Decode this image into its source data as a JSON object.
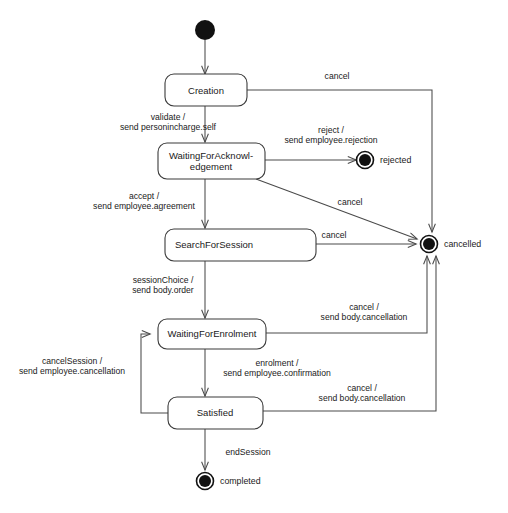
{
  "diagram": {
    "type": "uml-state-diagram",
    "colors": {
      "background": "#ffffff",
      "stroke": "#4a4a4a",
      "box_stroke": "#3b3b3b",
      "text": "#1a1a1a",
      "node_fill": "#111111"
    },
    "states": [
      {
        "id": "creation",
        "label": "Creation",
        "kind": "state"
      },
      {
        "id": "waiting_ack",
        "label_line1": "WaitingForAcknowl-",
        "label_line2": "edgement",
        "label": "WaitingForAcknowledgement",
        "kind": "state"
      },
      {
        "id": "search",
        "label": "SearchForSession",
        "kind": "state"
      },
      {
        "id": "waiting_enrolment",
        "label": "WaitingForEnrolment",
        "kind": "state"
      },
      {
        "id": "satisfied",
        "label": "Satisfied",
        "kind": "state"
      }
    ],
    "pseudostates": [
      {
        "id": "initial",
        "label": "",
        "kind": "initial"
      },
      {
        "id": "rejected",
        "label": "rejected",
        "kind": "final"
      },
      {
        "id": "cancelled",
        "label": "cancelled",
        "kind": "final"
      },
      {
        "id": "completed",
        "label": "completed",
        "kind": "final"
      }
    ],
    "transitions": [
      {
        "id": "t1",
        "from": "initial",
        "to": "creation",
        "label": ""
      },
      {
        "id": "t2",
        "from": "creation",
        "to": "waiting_ack",
        "line1": "validate /",
        "line2": "send personincharge.self"
      },
      {
        "id": "t3",
        "from": "creation",
        "to": "cancelled",
        "line1": "cancel",
        "line2": ""
      },
      {
        "id": "t4",
        "from": "waiting_ack",
        "to": "rejected",
        "line1": "reject /",
        "line2": "send employee.rejection"
      },
      {
        "id": "t5",
        "from": "waiting_ack",
        "to": "search",
        "line1": "accept /",
        "line2": "send employee.agreement"
      },
      {
        "id": "t6",
        "from": "waiting_ack",
        "to": "cancelled",
        "line1": "cancel",
        "line2": ""
      },
      {
        "id": "t7",
        "from": "search",
        "to": "cancelled",
        "line1": "cancel",
        "line2": ""
      },
      {
        "id": "t8",
        "from": "search",
        "to": "waiting_enrolment",
        "line1": "sessionChoice /",
        "line2": "send body.order"
      },
      {
        "id": "t9",
        "from": "waiting_enrolment",
        "to": "cancelled",
        "line1": "cancel /",
        "line2": "send body.cancellation"
      },
      {
        "id": "t10",
        "from": "waiting_enrolment",
        "to": "satisfied",
        "line1": "enrolment /",
        "line2": "send employee.confirmation"
      },
      {
        "id": "t11",
        "from": "satisfied",
        "to": "waiting_enrolment",
        "line1": "cancelSession /",
        "line2": "send employee.cancellation"
      },
      {
        "id": "t12",
        "from": "satisfied",
        "to": "cancelled",
        "line1": "cancel /",
        "line2": "send body.cancellation"
      },
      {
        "id": "t13",
        "from": "satisfied",
        "to": "completed",
        "line1": "endSession",
        "line2": ""
      }
    ]
  }
}
